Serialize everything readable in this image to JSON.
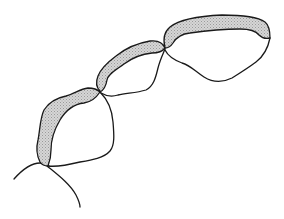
{
  "diagram": {
    "type": "line-drawing",
    "colors": {
      "stroke": "#1a1a1a",
      "band_fill": "#cfcfcf",
      "background": "#ffffff"
    },
    "segments": [
      {
        "id": "segment-1",
        "position": "lower-left",
        "shaded_band": "left/upper edge"
      },
      {
        "id": "segment-2",
        "position": "middle",
        "shaded_band": "upper edge"
      },
      {
        "id": "segment-3",
        "position": "upper-right",
        "shaded_band": "upper edge"
      }
    ],
    "junctions": 3,
    "tails": 2,
    "labels": []
  }
}
